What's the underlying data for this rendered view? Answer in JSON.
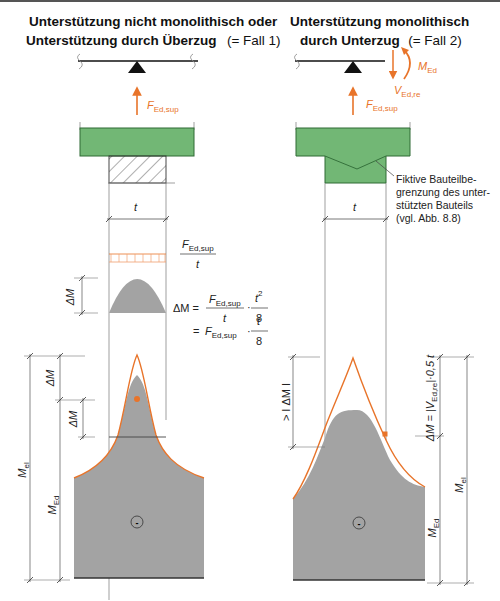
{
  "figure": {
    "left_panel": {
      "title_line1": "Unterstützung nicht monolithisch oder",
      "title_line2_bold": "Unterstützung durch Überzug",
      "title_line2_normal": "(= Fall 1)",
      "force_label": "F",
      "force_sub": "Ed,sup",
      "width_label": "t",
      "load_fraction_num": "F",
      "load_fraction_num_sub": "Ed,sup",
      "load_fraction_den": "t",
      "delta_m_label": "ΔM",
      "formula": {
        "lhs": "ΔM =",
        "frac1_num": "F",
        "frac1_num_sub": "Ed,sup",
        "frac1_den": "t",
        "dot": "·",
        "frac2_num": "t",
        "frac2_num_sup": "2",
        "frac2_den": "8",
        "eq2": "=",
        "term2": "F",
        "term2_sub": "Ed,sup",
        "frac3_num": "t",
        "frac3_den": "8"
      },
      "dim_labels": {
        "delta_m_upper": "ΔM",
        "delta_m_lower": "ΔM",
        "m_el": "M",
        "m_el_sub": "el",
        "m_ed": "M",
        "m_ed_sub": "Ed"
      },
      "sign_symbol": "-"
    },
    "right_panel": {
      "title_line1": "Unterstützung monolithisch",
      "title_line2_bold": "durch Unterzug",
      "title_line2_normal": "(= Fall 2)",
      "moment_label": "M",
      "moment_sub": "Ed",
      "shear_label": "V",
      "shear_sub": "Ed,re",
      "force_label": "F",
      "force_sub": "Ed,sup",
      "width_label": "t",
      "note_lines": [
        "Fiktive Bauteilbe-",
        "grenzung des unter-",
        "stützten Bauteils",
        "(vgl. Abb. 8.8)"
      ],
      "dim_labels": {
        "gt_delta_m": "> I ΔM I",
        "delta_m_formula": "ΔM = |V",
        "delta_m_formula_sub": "Ed,re",
        "delta_m_formula_tail": "|·0,5 t",
        "m_el": "M",
        "m_el_sub": "el",
        "m_ed": "M",
        "m_ed_sub": "Ed"
      },
      "sign_symbol": "-"
    },
    "colors": {
      "green": "#72b775",
      "green_dark": "#2f6a35",
      "moment_gray": "#a3a3a3",
      "orange": "#e8742a",
      "line": "#555555"
    }
  }
}
